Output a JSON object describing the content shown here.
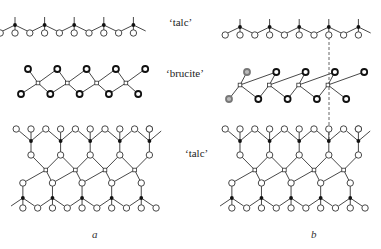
{
  "labels": {
    "talc_top": "‘talc’",
    "brucite": "‘brucite’",
    "talc_bottom": "‘talc’"
  },
  "panels": {
    "a": "a",
    "b": "b"
  },
  "legend_semantics": {
    "black_dot": "silicon (tetrahedral cation)",
    "open_circle": "oxygen",
    "small_square": "octahedral cation",
    "dark_ringed_circle": "hydroxyl"
  },
  "colors": {
    "line": "#333333",
    "fill_dark": "#111111",
    "background": "#ffffff"
  }
}
